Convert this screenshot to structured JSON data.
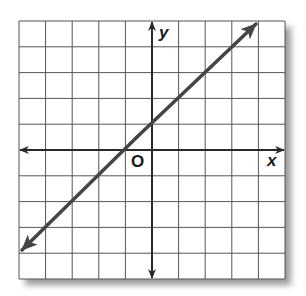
{
  "figure": {
    "type": "coordinate-plane-line-graph",
    "x_axis_label": "x",
    "y_axis_label": "y",
    "origin_label": "O",
    "grid": {
      "columns": 10,
      "rows": 10,
      "x_range": [
        -5,
        5
      ],
      "y_range": [
        -5,
        5
      ],
      "tick_labels_shown": false
    },
    "line": {
      "equation": "y = x + 1",
      "slope": 1,
      "y_intercept": 1,
      "x_intercept": -1,
      "arrows_both_ends": true,
      "approx_endpoints": [
        [
          -4.9,
          -3.9
        ],
        [
          3.8,
          4.8
        ]
      ]
    },
    "colors": {
      "grid": "#555555",
      "axes": "#2a2a2a",
      "line": "#454545",
      "shadow": "#9a9a9a",
      "background": "#ffffff"
    }
  }
}
